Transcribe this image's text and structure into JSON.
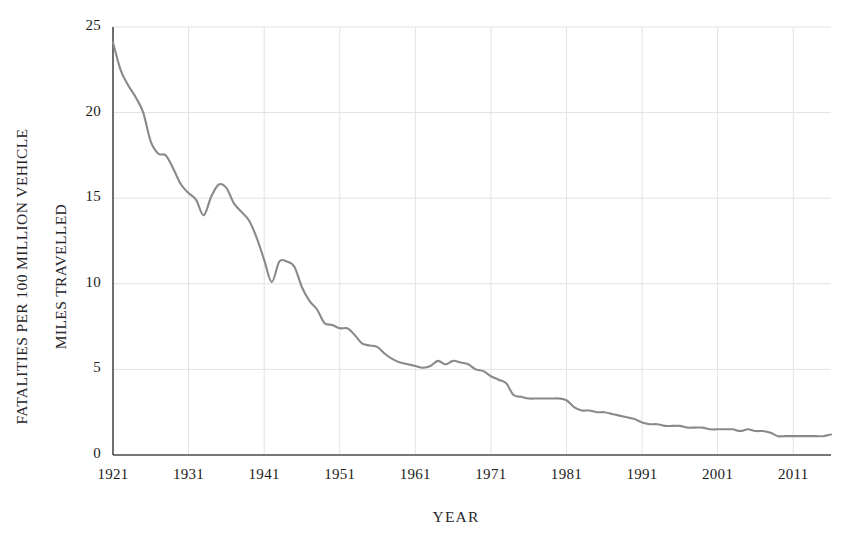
{
  "chart_data": {
    "type": "line",
    "title": "",
    "xlabel": "YEAR",
    "ylabel": "FATALITIES PER 100 MILLION VEHICLE MILES TRAVELLED",
    "ylabel_line1": "FATALITIES PER 100 MILLION VEHICLE",
    "ylabel_line2": "MILES TRAVELLED",
    "xlim": [
      1921,
      2016
    ],
    "ylim": [
      0,
      25
    ],
    "yticks": [
      0,
      5,
      10,
      15,
      20,
      25
    ],
    "ytick_labels": [
      "0",
      "5",
      "10",
      "15",
      "20",
      "25"
    ],
    "xticks": [
      1921,
      1931,
      1941,
      1951,
      1961,
      1971,
      1981,
      1991,
      2001,
      2011
    ],
    "xtick_labels": [
      "1921",
      "1931",
      "1941",
      "1951",
      "1961",
      "1971",
      "1981",
      "1991",
      "2001",
      "2011"
    ],
    "grid": true,
    "grid_color": "#e2e2e2",
    "axis_color": "#4a4a4a",
    "line_color": "#8a8a8a",
    "background": "#ffffff",
    "legend": null,
    "series": [
      {
        "name": "Fatality rate per 100 million VMT",
        "color": "#8a8a8a",
        "x": [
          1921,
          1922,
          1923,
          1924,
          1925,
          1926,
          1927,
          1928,
          1929,
          1930,
          1931,
          1932,
          1933,
          1934,
          1935,
          1936,
          1937,
          1938,
          1939,
          1940,
          1941,
          1942,
          1943,
          1944,
          1945,
          1946,
          1947,
          1948,
          1949,
          1950,
          1951,
          1952,
          1953,
          1954,
          1955,
          1956,
          1957,
          1958,
          1959,
          1960,
          1961,
          1962,
          1963,
          1964,
          1965,
          1966,
          1967,
          1968,
          1969,
          1970,
          1971,
          1972,
          1973,
          1974,
          1975,
          1976,
          1977,
          1978,
          1979,
          1980,
          1981,
          1982,
          1983,
          1984,
          1985,
          1986,
          1987,
          1988,
          1989,
          1990,
          1991,
          1992,
          1993,
          1994,
          1995,
          1996,
          1997,
          1998,
          1999,
          2000,
          2001,
          2002,
          2003,
          2004,
          2005,
          2006,
          2007,
          2008,
          2009,
          2010,
          2011,
          2012,
          2013,
          2014,
          2015,
          2016
        ],
        "values": [
          24.1,
          22.5,
          21.6,
          20.9,
          20.0,
          18.3,
          17.6,
          17.5,
          16.7,
          15.8,
          15.3,
          14.9,
          14.0,
          15.1,
          15.8,
          15.6,
          14.7,
          14.2,
          13.7,
          12.7,
          11.4,
          10.1,
          11.3,
          11.3,
          11.0,
          9.8,
          9.0,
          8.5,
          7.7,
          7.6,
          7.4,
          7.4,
          7.0,
          6.5,
          6.4,
          6.3,
          5.9,
          5.6,
          5.4,
          5.3,
          5.2,
          5.1,
          5.2,
          5.5,
          5.3,
          5.5,
          5.4,
          5.3,
          5.0,
          4.9,
          4.6,
          4.4,
          4.2,
          3.5,
          3.4,
          3.3,
          3.3,
          3.3,
          3.3,
          3.3,
          3.2,
          2.8,
          2.6,
          2.6,
          2.5,
          2.5,
          2.4,
          2.3,
          2.2,
          2.1,
          1.9,
          1.8,
          1.8,
          1.7,
          1.7,
          1.7,
          1.6,
          1.6,
          1.6,
          1.5,
          1.5,
          1.5,
          1.5,
          1.4,
          1.5,
          1.4,
          1.4,
          1.3,
          1.1,
          1.1,
          1.1,
          1.1,
          1.1,
          1.1,
          1.1,
          1.2
        ]
      }
    ]
  },
  "plot_geometry": {
    "left": 113,
    "right": 831,
    "top": 27,
    "bottom": 455
  }
}
